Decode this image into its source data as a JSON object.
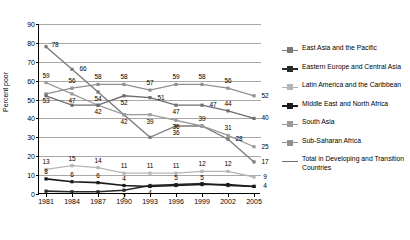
{
  "chart_data": {
    "type": "line",
    "title": "",
    "xlabel": "",
    "ylabel": "Percent poor",
    "x": [
      1981,
      1984,
      1987,
      1990,
      1993,
      1996,
      1999,
      2002,
      2005
    ],
    "xticklabels": [
      "1981",
      "1984",
      "1987",
      "1990",
      "1993",
      "1996",
      "1999",
      "2002",
      "2005"
    ],
    "ylim": [
      0,
      90
    ],
    "yticks": [
      0,
      10,
      20,
      30,
      40,
      50,
      60,
      70,
      80,
      90
    ],
    "yticklabels": [
      "0",
      "10",
      "20",
      "30",
      "40",
      "50",
      "60",
      "70",
      "80",
      "90"
    ],
    "grid": true,
    "legend_position": "right",
    "series": [
      {
        "name": "East Asia and the Pacific",
        "color": "#7a7a7a",
        "values": [
          78,
          66,
          54,
          42,
          30,
          36,
          36,
          29,
          17
        ],
        "labels": [
          "78",
          "66",
          "54",
          "",
          "",
          "36",
          "",
          "28",
          "17"
        ],
        "label_pos": [
          "above-right",
          "right",
          "below",
          "",
          "",
          "below",
          "",
          "right",
          "right"
        ]
      },
      {
        "name": "Eastern Europe and Central Asia",
        "color": "#2b2b2b",
        "values": [
          1.5,
          1.2,
          1.2,
          2,
          4.5,
          5,
          5.5,
          4.5,
          4
        ],
        "labels": [
          "",
          "",
          "",
          "2",
          "4",
          "5",
          "",
          "",
          "4"
        ],
        "label_pos": [
          "",
          "",
          "",
          "below",
          "below",
          "above",
          "",
          "",
          "right"
        ]
      },
      {
        "name": "Latin America and the Caribbean",
        "color": "#b5b5b5",
        "values": [
          13,
          15,
          14,
          11,
          11,
          11,
          12,
          12,
          9
        ],
        "labels": [
          "13",
          "15",
          "14",
          "11",
          "11",
          "11",
          "12",
          "12",
          "9"
        ],
        "label_pos": [
          "above",
          "above",
          "above",
          "above",
          "above",
          "above",
          "above",
          "above",
          "right"
        ]
      },
      {
        "name": "Middle East and North Africa",
        "color": "#1a1a1a",
        "values": [
          8,
          6.5,
          6,
          4.5,
          4,
          4.5,
          5,
          5,
          4
        ],
        "labels": [
          "8",
          "6",
          "6",
          "4",
          "",
          "",
          "5",
          "",
          ""
        ],
        "label_pos": [
          "above",
          "above",
          "above",
          "above",
          "",
          "",
          "above",
          "",
          ""
        ]
      },
      {
        "name": "South Asia",
        "color": "#9a9a9a",
        "values": [
          59,
          53,
          47,
          42,
          42,
          39,
          36,
          31,
          25
        ],
        "labels": [
          "59",
          "47",
          "42",
          "42",
          "39",
          "36",
          "39",
          "31",
          "25"
        ],
        "label_pos": [
          "above",
          "below",
          "below",
          "below",
          "below",
          "below",
          "above",
          "above",
          "right"
        ]
      },
      {
        "name": "Sub-Saharan Africa",
        "color": "#8f8f8f",
        "values": [
          53,
          56,
          58,
          58,
          55,
          58,
          58,
          56,
          52
        ],
        "labels": [
          "53",
          "56",
          "58",
          "58",
          "57",
          "59",
          "58",
          "56",
          "52"
        ],
        "label_pos": [
          "below",
          "above",
          "above",
          "above",
          "above",
          "above",
          "above",
          "above",
          "right"
        ]
      },
      {
        "name": "Total in Developing and Transition Countries",
        "color": "#6e6e6e",
        "values": [
          52,
          47,
          47,
          52,
          51,
          47,
          47,
          44,
          40
        ],
        "labels": [
          "",
          "",
          "",
          "52",
          "51",
          "47",
          "47",
          "44",
          "40"
        ],
        "label_pos": [
          "",
          "",
          "",
          "below",
          "right",
          "below",
          "right",
          "above",
          "right"
        ]
      }
    ]
  },
  "legend": {
    "items": [
      {
        "label": "East Asia and the Pacific",
        "color": "#7a7a7a"
      },
      {
        "label": "Eastern Europe and Central Asia",
        "color": "#2b2b2b"
      },
      {
        "label": "Latin America and the Caribbean",
        "color": "#b5b5b5"
      },
      {
        "label": "Middle East and North Africa",
        "color": "#1a1a1a"
      },
      {
        "label": "South Asia",
        "color": "#9a9a9a"
      },
      {
        "label": "Sub-Saharan Africa",
        "color": "#8f8f8f"
      },
      {
        "label": "Total in Developing and Transition Countries",
        "color": "#6e6e6e"
      }
    ]
  }
}
